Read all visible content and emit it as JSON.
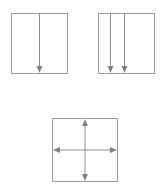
{
  "page": {
    "width": 166,
    "height": 187,
    "background_color": "#ffffff",
    "stroke_color": "#9a9a9a",
    "arrow_color": "#808080",
    "title": ""
  },
  "diagram": {
    "name": "force-direction-squares",
    "figure_count": 3,
    "figures": [
      {
        "id": "figure-1",
        "label": "",
        "shape": "square",
        "x": 11,
        "y": 13,
        "width": 57,
        "height": 61,
        "arrow_count": 1,
        "arrows": [
          {
            "name": "down-arrow-center",
            "direction": "down",
            "x_fraction": 0.5,
            "from_edge": "top",
            "to_edge": "bottom"
          }
        ]
      },
      {
        "id": "figure-2",
        "label": "",
        "shape": "square",
        "x": 98,
        "y": 13,
        "width": 57,
        "height": 61,
        "arrow_count": 2,
        "arrows": [
          {
            "name": "down-arrow-left",
            "direction": "down",
            "x_fraction": 0.21,
            "from_edge": "top",
            "to_edge": "bottom"
          },
          {
            "name": "down-arrow-mid",
            "direction": "down",
            "x_fraction": 0.45,
            "from_edge": "top",
            "to_edge": "bottom"
          }
        ]
      },
      {
        "id": "figure-3",
        "label": "",
        "shape": "square",
        "x": 52,
        "y": 118,
        "width": 66,
        "height": 64,
        "arrow_count": 4,
        "arrows": [
          {
            "name": "up-arrow",
            "direction": "up",
            "x_fraction": 0.5,
            "y_fraction": 0.5,
            "from_edge": "center",
            "to_edge": "top"
          },
          {
            "name": "down-arrow",
            "direction": "down",
            "x_fraction": 0.5,
            "y_fraction": 0.5,
            "from_edge": "center",
            "to_edge": "bottom"
          },
          {
            "name": "left-arrow",
            "direction": "left",
            "x_fraction": 0.5,
            "y_fraction": 0.5,
            "from_edge": "center",
            "to_edge": "left"
          },
          {
            "name": "right-arrow",
            "direction": "right",
            "x_fraction": 0.5,
            "y_fraction": 0.5,
            "from_edge": "center",
            "to_edge": "right"
          }
        ]
      }
    ]
  }
}
